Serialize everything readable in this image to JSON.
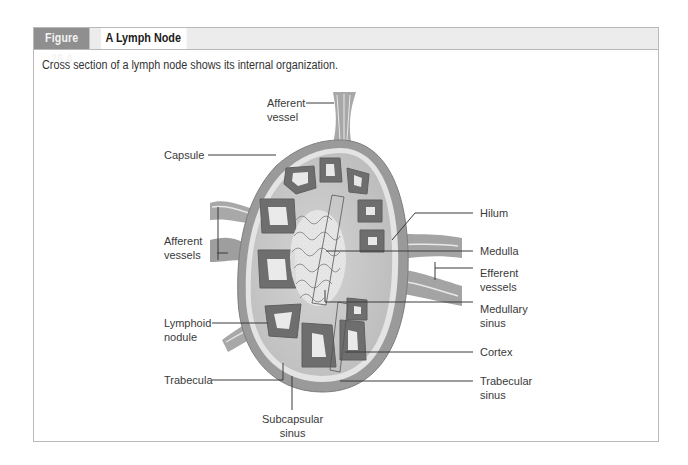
{
  "figure": {
    "number": "Figure 26.4",
    "title": "A Lymph Node",
    "caption": "Cross section of a lymph node shows its internal organization."
  },
  "labels": {
    "afferent_vessel": [
      "Afferent",
      "vessel"
    ],
    "capsule": "Capsule",
    "afferent_vessels": [
      "Afferent",
      "vessels"
    ],
    "lymphoid_nodule": [
      "Lymphoid",
      "nodule"
    ],
    "trabecula": "Trabecula",
    "subcapsular_sinus": [
      "Subcapsular",
      "sinus"
    ],
    "hilum": "Hilum",
    "medulla": "Medulla",
    "efferent_vessels": [
      "Efferent",
      "vessels"
    ],
    "medullary_sinus": [
      "Medullary",
      "sinus"
    ],
    "cortex": "Cortex",
    "trabecular_sinus": [
      "Trabecular",
      "sinus"
    ]
  },
  "colors": {
    "header_tab": "#8f8f8f",
    "header_bar": "#ececec",
    "frame_border": "#b9b9b9",
    "capsule_fill": "#9a9a9a",
    "nodule_dark": "#6e6e6e",
    "germinal_center": "#e6e6e6",
    "medulla_fill": "#c4c4c4",
    "leader_line": "#333333"
  }
}
